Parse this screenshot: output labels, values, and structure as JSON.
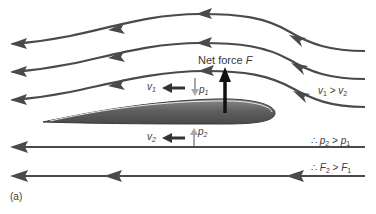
{
  "figure": {
    "panel_label": "(a)",
    "net_force_label": "Net force",
    "net_force_symbol": "F",
    "v1": {
      "sym": "v",
      "sub": "1"
    },
    "v2": {
      "sym": "v",
      "sub": "2"
    },
    "p1": {
      "sym": "p",
      "sub": "1"
    },
    "p2": {
      "sym": "p",
      "sub": "2"
    },
    "velocity_relation": {
      "a": "v",
      "a_sub": "1",
      "op": ">",
      "b": "v",
      "b_sub": "2"
    },
    "pressure_relation": {
      "prefix": "∴",
      "a": "p",
      "a_sub": "2",
      "op": ">",
      "b": "p",
      "b_sub": "1"
    },
    "force_relation": {
      "prefix": "∴",
      "a": "F",
      "a_sub": "2",
      "op": ">",
      "b": "F",
      "b_sub": "1"
    }
  },
  "colors": {
    "streamline": "#4a4a4a",
    "airfoil_dark": "#555555",
    "airfoil_light": "#8a8a8a",
    "force_arrow": "#111111",
    "pressure_arrow": "#a8a8a8"
  }
}
